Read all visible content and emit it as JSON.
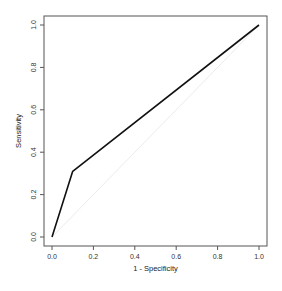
{
  "chart_data": {
    "type": "line",
    "title": "",
    "xlabel": "1 - Specificity",
    "ylabel": "Sensitivity",
    "xlim": [
      0,
      1
    ],
    "ylim": [
      0,
      1
    ],
    "grid": false,
    "legend": null,
    "x_ticks": [
      "0.0",
      "0.2",
      "0.4",
      "0.6",
      "0.8",
      "1.0"
    ],
    "y_ticks": [
      "0.0",
      "0.2",
      "0.4",
      "0.6",
      "0.8",
      "1.0"
    ],
    "series": [
      {
        "name": "ROC curve",
        "color": "#111111",
        "points": [
          [
            0.0,
            0.0
          ],
          [
            0.1,
            0.31
          ],
          [
            1.0,
            1.0
          ]
        ]
      },
      {
        "name": "reference diagonal",
        "color": "#e6e6e6",
        "points": [
          [
            0.0,
            0.0
          ],
          [
            1.0,
            1.0
          ]
        ]
      }
    ]
  }
}
